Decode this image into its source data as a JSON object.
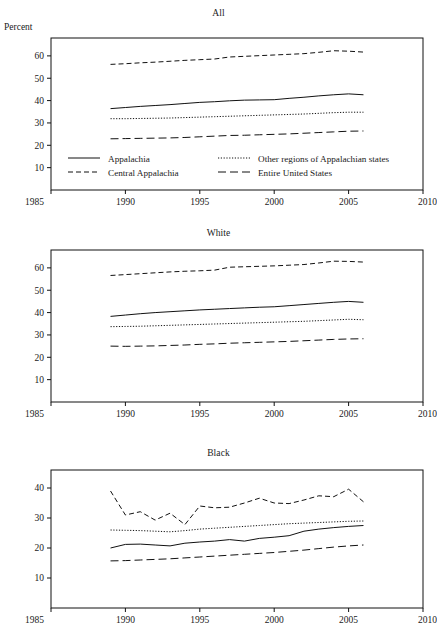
{
  "figure": {
    "cut_header_text": "",
    "y_axis_label": "Percent"
  },
  "legend": {
    "appalachia": "Appalachia",
    "central_appalachia": "Central Appalachia",
    "other_regions": "Other regions of Appalachian states",
    "entire_us": "Entire United States"
  },
  "panels": [
    {
      "id": "all",
      "title": "All"
    },
    {
      "id": "white",
      "title": "White"
    },
    {
      "id": "black",
      "title": "Black"
    }
  ],
  "axis": {
    "x_ticks": [
      "1985",
      "1990",
      "1995",
      "2000",
      "2005",
      "2010"
    ],
    "y_ticks_all": [
      "10",
      "20",
      "30",
      "40",
      "50",
      "60"
    ],
    "y_ticks_white": [
      "10",
      "20",
      "30",
      "40",
      "50",
      "60"
    ],
    "y_ticks_black": [
      "10",
      "20",
      "30",
      "40"
    ]
  },
  "chart_data": [
    {
      "type": "line",
      "title": "All",
      "xlabel": "",
      "ylabel": "Percent",
      "xlim": [
        1985,
        2010
      ],
      "ylim": [
        0,
        68
      ],
      "grid": false,
      "legend_position": "inside-bottom",
      "x": [
        1989,
        1990,
        1991,
        1992,
        1993,
        1994,
        1995,
        1996,
        1997,
        1998,
        1999,
        2000,
        2001,
        2002,
        2003,
        2004,
        2005,
        2006
      ],
      "series": [
        {
          "name": "Appalachia",
          "style": "solid",
          "values": [
            36.4,
            36.9,
            37.4,
            37.8,
            38.2,
            38.7,
            39.2,
            39.5,
            39.9,
            40.2,
            40.3,
            40.4,
            41.0,
            41.5,
            42.1,
            42.6,
            43.0,
            42.6
          ]
        },
        {
          "name": "Central Appalachia",
          "style": "dashed",
          "values": [
            56.2,
            56.5,
            56.9,
            57.2,
            57.6,
            58.0,
            58.3,
            58.6,
            59.5,
            59.8,
            60.1,
            60.4,
            60.7,
            61.0,
            61.6,
            62.3,
            62.1,
            61.7
          ]
        },
        {
          "name": "Other regions of Appalachian states",
          "style": "dotted",
          "values": [
            31.9,
            31.9,
            32.0,
            32.1,
            32.2,
            32.4,
            32.6,
            32.8,
            33.0,
            33.2,
            33.4,
            33.6,
            33.8,
            34.0,
            34.3,
            34.6,
            34.8,
            34.8
          ]
        },
        {
          "name": "Entire United States",
          "style": "longdash",
          "values": [
            22.9,
            23.0,
            23.1,
            23.2,
            23.3,
            23.5,
            23.8,
            24.1,
            24.4,
            24.5,
            24.7,
            24.9,
            25.1,
            25.4,
            25.7,
            26.0,
            26.3,
            26.4
          ]
        }
      ]
    },
    {
      "type": "line",
      "title": "White",
      "xlabel": "",
      "ylabel": "",
      "xlim": [
        1985,
        2010
      ],
      "ylim": [
        0,
        68
      ],
      "grid": false,
      "legend_position": "none",
      "x": [
        1989,
        1990,
        1991,
        1992,
        1993,
        1994,
        1995,
        1996,
        1997,
        1998,
        1999,
        2000,
        2001,
        2002,
        2003,
        2004,
        2005,
        2006
      ],
      "series": [
        {
          "name": "Appalachia",
          "style": "solid",
          "values": [
            38.3,
            38.9,
            39.5,
            40.0,
            40.4,
            40.8,
            41.2,
            41.5,
            41.8,
            42.1,
            42.4,
            42.6,
            43.1,
            43.6,
            44.1,
            44.6,
            45.0,
            44.6
          ]
        },
        {
          "name": "Central Appalachia",
          "style": "dashed",
          "values": [
            56.6,
            57.0,
            57.4,
            57.8,
            58.2,
            58.5,
            58.7,
            59.0,
            60.3,
            60.5,
            60.7,
            60.9,
            61.2,
            61.5,
            62.2,
            63.0,
            62.9,
            62.6
          ]
        },
        {
          "name": "Other regions of Appalachian states",
          "style": "dotted",
          "values": [
            33.7,
            33.8,
            33.9,
            34.1,
            34.3,
            34.5,
            34.7,
            34.9,
            35.1,
            35.3,
            35.5,
            35.7,
            35.9,
            36.1,
            36.4,
            36.7,
            37.0,
            36.8
          ]
        },
        {
          "name": "Entire United States",
          "style": "longdash",
          "values": [
            25.0,
            24.9,
            25.0,
            25.1,
            25.3,
            25.5,
            25.8,
            26.0,
            26.3,
            26.5,
            26.7,
            26.9,
            27.1,
            27.4,
            27.7,
            28.0,
            28.2,
            28.3
          ]
        }
      ]
    },
    {
      "type": "line",
      "title": "Black",
      "xlabel": "",
      "ylabel": "",
      "xlim": [
        1985,
        2010
      ],
      "ylim": [
        0,
        46
      ],
      "grid": false,
      "legend_position": "none",
      "x": [
        1989,
        1990,
        1991,
        1992,
        1993,
        1994,
        1995,
        1996,
        1997,
        1998,
        1999,
        2000,
        2001,
        2002,
        2003,
        2004,
        2005,
        2006
      ],
      "series": [
        {
          "name": "Appalachia",
          "style": "solid",
          "values": [
            20.0,
            21.2,
            21.3,
            21.0,
            20.7,
            21.6,
            22.0,
            22.3,
            22.8,
            22.3,
            23.2,
            23.6,
            24.1,
            25.6,
            26.3,
            26.8,
            27.2,
            27.5
          ]
        },
        {
          "name": "Central Appalachia",
          "style": "dashed",
          "values": [
            39.0,
            31.0,
            32.1,
            29.3,
            31.6,
            27.8,
            34.0,
            33.4,
            33.6,
            35.0,
            36.6,
            35.0,
            34.8,
            36.0,
            37.4,
            37.1,
            39.6,
            35.4
          ]
        },
        {
          "name": "Other regions of Appalachian states",
          "style": "dotted",
          "values": [
            26.0,
            25.9,
            25.8,
            25.6,
            25.4,
            25.8,
            26.3,
            26.6,
            26.9,
            27.2,
            27.5,
            27.8,
            28.1,
            28.3,
            28.5,
            28.7,
            28.9,
            29.0
          ]
        },
        {
          "name": "Entire United States",
          "style": "longdash",
          "values": [
            15.7,
            15.8,
            16.0,
            16.2,
            16.4,
            16.7,
            17.0,
            17.3,
            17.6,
            17.9,
            18.2,
            18.5,
            18.9,
            19.3,
            19.8,
            20.3,
            20.7,
            21.0
          ]
        }
      ]
    }
  ]
}
